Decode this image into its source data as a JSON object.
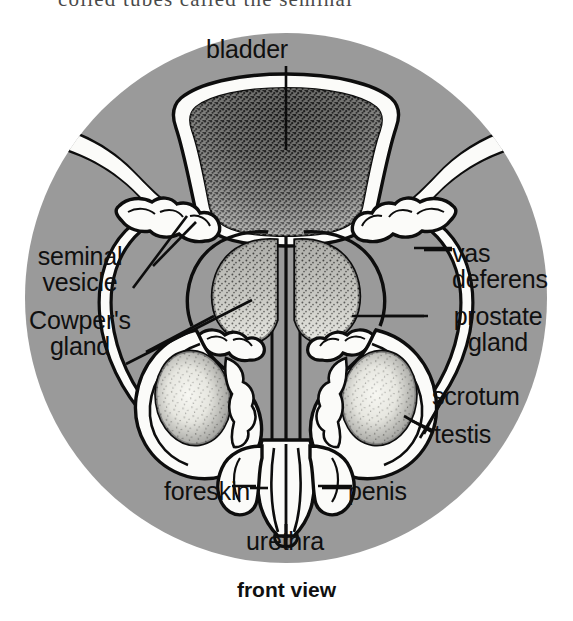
{
  "page": {
    "clipped_body_text": "coiled tubes called the seminal",
    "caption": "front view"
  },
  "diagram": {
    "title": "bladder",
    "labels": {
      "bladder": "bladder",
      "seminal_vesicle": "seminal\nvesicle",
      "cowpers_gland": "Cowper's\ngland",
      "vas_deferens": "vas\ndeferens",
      "prostate_gland": "prostate\ngland",
      "scrotum": "scrotum",
      "testis": "testis",
      "foreskin": "foreskin",
      "penis": "penis",
      "urethra": "urethra"
    },
    "colors": {
      "background": "#ffffff",
      "circle_fill": "#9a9a9a",
      "organ_fill": "#fbfbf9",
      "outline": "#0d0d0d",
      "stipple_dark": "#2a2a2a",
      "label_text": "#101010"
    }
  }
}
